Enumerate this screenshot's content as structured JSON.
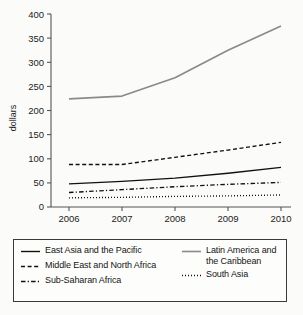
{
  "chart_data": {
    "type": "line",
    "title": "",
    "xlabel": "",
    "ylabel": "dollars",
    "x": [
      "2006",
      "2007",
      "2008",
      "2009",
      "2010"
    ],
    "xtick_labels": [
      "2006",
      "2007",
      "2008",
      "2009",
      "2010"
    ],
    "ytick_labels": [
      "0",
      "50",
      "100",
      "150",
      "200",
      "250",
      "300",
      "350",
      "400"
    ],
    "yticks": [
      0,
      50,
      100,
      150,
      200,
      250,
      300,
      350,
      400
    ],
    "ylim": [
      0,
      400
    ],
    "grid": false,
    "legend_position": "below-plot",
    "series": [
      {
        "name": "East Asia and the Pacific",
        "style": "solid",
        "color": "#111111",
        "values": [
          48,
          53,
          60,
          70,
          82
        ]
      },
      {
        "name": "Latin America and the Caribbean",
        "style": "solid",
        "color": "#8a8a8a",
        "values": [
          224,
          230,
          268,
          325,
          375
        ]
      },
      {
        "name": "Middle East and North Africa",
        "style": "dashed",
        "color": "#111111",
        "values": [
          88,
          88,
          103,
          118,
          134
        ]
      },
      {
        "name": "South Asia",
        "style": "dotted",
        "color": "#111111",
        "values": [
          19,
          20,
          22,
          23,
          25
        ]
      },
      {
        "name": "Sub-Saharan Africa",
        "style": "dash-dot",
        "color": "#111111",
        "values": [
          30,
          36,
          42,
          47,
          51
        ]
      }
    ]
  },
  "axis": {
    "y_label": "dollars",
    "y_ticks": [
      "400",
      "350",
      "300",
      "250",
      "200",
      "150",
      "100",
      "50",
      "0"
    ],
    "x_ticks": [
      "2006",
      "2007",
      "2008",
      "2009",
      "2010"
    ]
  },
  "legend": {
    "left_column": [
      {
        "label": "East Asia and the Pacific",
        "style": "solid",
        "color": "#111111"
      },
      {
        "label": "Middle East and North Africa",
        "style": "dashed",
        "color": "#111111"
      },
      {
        "label": "Sub-Saharan Africa",
        "style": "dash-dot",
        "color": "#111111"
      }
    ],
    "right_column": [
      {
        "label": "Latin America and the Caribbean",
        "style": "solid",
        "color": "#8a8a8a"
      },
      {
        "label": "South Asia",
        "style": "dotted",
        "color": "#111111"
      }
    ]
  }
}
